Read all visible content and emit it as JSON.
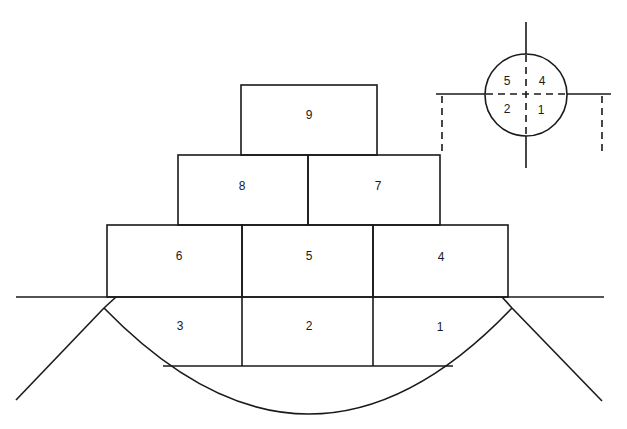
{
  "diagram": {
    "stroke_color": "#1a1a1a",
    "background": "#ffffff",
    "blocks": [
      {
        "id": "1",
        "label": "1"
      },
      {
        "id": "2",
        "label": "2"
      },
      {
        "id": "3",
        "label": "3"
      },
      {
        "id": "4",
        "label": "4"
      },
      {
        "id": "5",
        "label": "5"
      },
      {
        "id": "6",
        "label": "6"
      },
      {
        "id": "7",
        "label": "7"
      },
      {
        "id": "8",
        "label": "8"
      },
      {
        "id": "9",
        "label": "9"
      }
    ],
    "inset": {
      "quadrants": [
        {
          "label": "5"
        },
        {
          "label": "4"
        },
        {
          "label": "2"
        },
        {
          "label": "1"
        }
      ]
    }
  }
}
